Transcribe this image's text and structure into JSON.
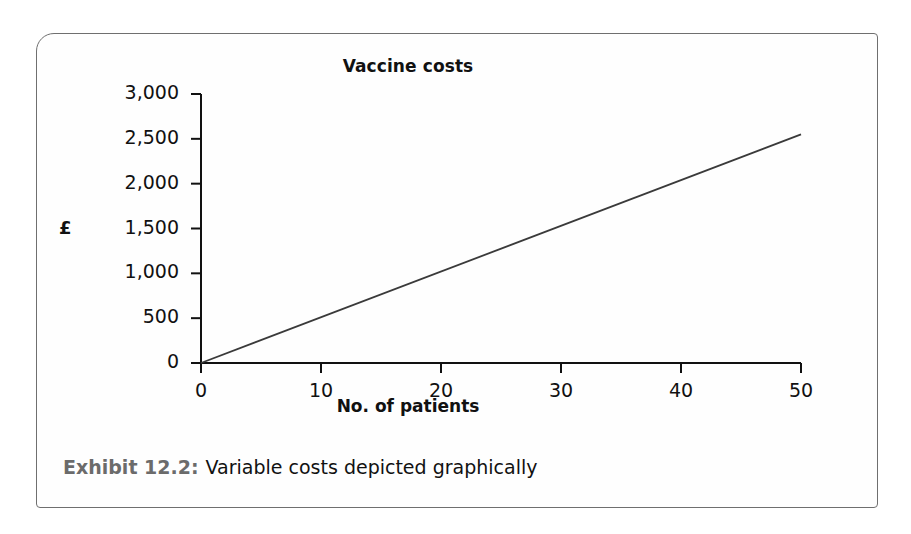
{
  "exhibit": {
    "caption_label": "Exhibit 12.2:",
    "caption_text": "Variable costs depicted graphically",
    "frame_border_color": "#6f6f6f"
  },
  "chart_data": {
    "type": "line",
    "title": "Vaccine costs",
    "xlabel": "No. of patients",
    "ylabel": "£",
    "xlim": [
      0,
      50
    ],
    "ylim": [
      0,
      3000
    ],
    "grid": false,
    "legend": false,
    "line_color": "#3a3a3a",
    "axis_color": "#111111",
    "x_ticks": [
      0,
      10,
      20,
      30,
      40,
      50
    ],
    "x_tick_labels": [
      "0",
      "10",
      "20",
      "30",
      "40",
      "50"
    ],
    "y_ticks": [
      0,
      500,
      1000,
      1500,
      2000,
      2500,
      3000
    ],
    "y_tick_labels": [
      "0",
      "500",
      "1,000",
      "1,500",
      "2,000",
      "2,500",
      "3,000"
    ],
    "series": [
      {
        "name": "Vaccine costs",
        "x": [
          0,
          50
        ],
        "values": [
          0,
          2550
        ],
        "slope_per_patient": 51
      }
    ]
  }
}
